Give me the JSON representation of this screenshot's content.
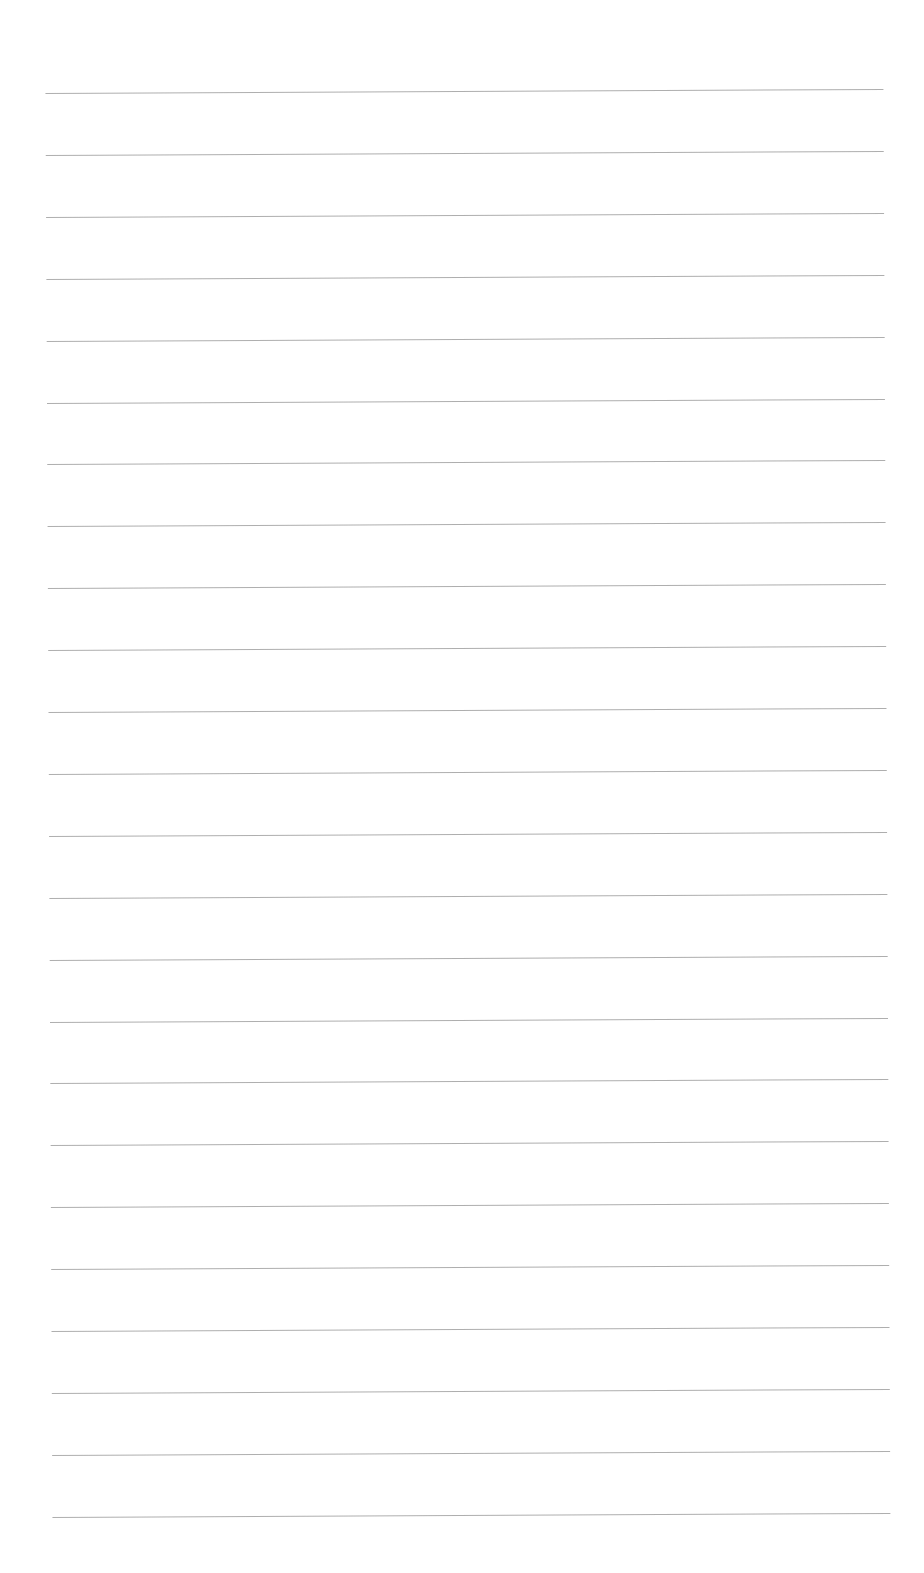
{
  "page": {
    "type": "blank lined paper",
    "line_count": 24,
    "first_line_y": 93,
    "line_spacing": 61.9,
    "line_color": "#a0a0a0",
    "background_color": "#ffffff",
    "text": []
  }
}
